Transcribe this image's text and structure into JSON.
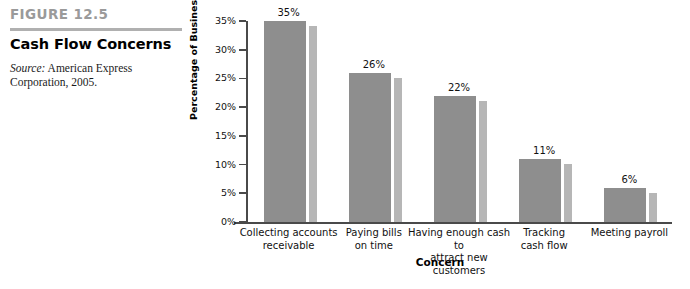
{
  "caption": {
    "figure_number": "FIGURE 12.5",
    "title": "Cash Flow Concerns",
    "source_label": "Source:",
    "source_text": " American Express Corporation, 2005."
  },
  "colors": {
    "bar_front": "#8e8e8e",
    "bar_side": "#b6b6b6",
    "figure_number": "#9a9a9a",
    "rule": "#b0b0b0",
    "axis": "#4a4a4a"
  },
  "chart_data": {
    "type": "bar",
    "title": "Cash Flow Concerns",
    "xlabel": "Concern",
    "ylabel": "Percentage of Business Owners",
    "categories": [
      "Collecting accounts receivable",
      "Paying bills on time",
      "Having enough cash to attract new customers",
      "Tracking cash flow",
      "Meeting payroll"
    ],
    "category_lines": [
      [
        "Collecting accounts",
        "receivable"
      ],
      [
        "Paying bills",
        "on time"
      ],
      [
        "Having enough cash to",
        "attract new customers"
      ],
      [
        "Tracking",
        "cash flow"
      ],
      [
        "Meeting payroll"
      ]
    ],
    "values": [
      35,
      26,
      22,
      11,
      6
    ],
    "data_labels": [
      "35%",
      "26%",
      "22%",
      "11%",
      "6%"
    ],
    "ylim": [
      0,
      35
    ],
    "ytick_values": [
      0,
      5,
      10,
      15,
      20,
      25,
      30,
      35
    ],
    "ytick_labels": [
      "0%",
      "5%",
      "10%",
      "15%",
      "20%",
      "25%",
      "30%",
      "35%"
    ],
    "grid": false,
    "legend": null,
    "style": "3d-side-panel"
  }
}
